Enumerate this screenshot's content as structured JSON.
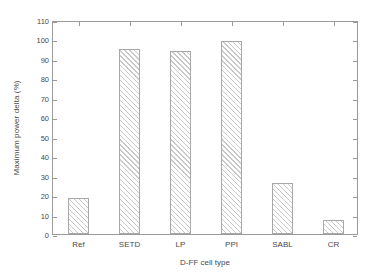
{
  "chart_data": {
    "type": "bar",
    "title": "",
    "subtitle": "",
    "xlabel": "D-FF cell type",
    "ylabel": "Maximum power delta (%)",
    "categories": [
      "Ref",
      "SETD",
      "LP",
      "PPI",
      "SABL",
      "CR"
    ],
    "values": [
      18.7,
      95,
      94,
      99,
      26,
      7
    ],
    "series": [
      {
        "name": "Maximum power delta",
        "values": [
          18.7,
          95,
          94,
          99,
          26,
          7
        ]
      }
    ],
    "ylim": [
      0,
      110
    ],
    "ytick_labels": [
      "0",
      "10",
      "20",
      "30",
      "40",
      "50",
      "60",
      "70",
      "80",
      "90",
      "100",
      "110"
    ],
    "ytick_values": [
      0,
      10,
      20,
      30,
      40,
      50,
      60,
      70,
      80,
      90,
      100,
      110
    ],
    "ytick_step": 10,
    "grid": false,
    "legend": false,
    "legend_position": "none",
    "bar_fill": "#ffffff",
    "bar_hatch": "diagonal-forward",
    "bar_hatch_color": "#c9c9c9",
    "bar_edge_color": "#a8a8a8",
    "axis_color": "#9a9a9a",
    "text_color": "#4a4a4a",
    "background": "#ffffff",
    "annotations": []
  }
}
